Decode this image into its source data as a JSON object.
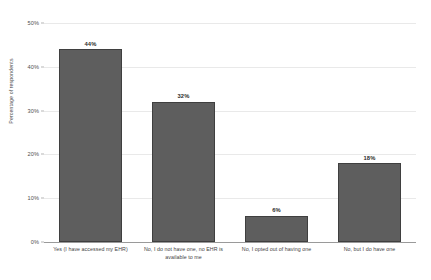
{
  "chart_data": {
    "type": "bar",
    "title": "",
    "xlabel": "",
    "ylabel": "Percentage of respondents",
    "categories": [
      "Yes (I have accessed my EHR)",
      "No, I do not have one, no EHR is available to me",
      "No, I opted out of having one",
      "No, but I do have one"
    ],
    "values": [
      44,
      32,
      6,
      18
    ],
    "value_labels": [
      "44%",
      "32%",
      "6%",
      "18%"
    ],
    "ylim": [
      0,
      50
    ],
    "yticks": [
      0,
      10,
      20,
      30,
      40,
      50
    ],
    "ytick_labels": [
      "0%",
      "10%",
      "20%",
      "30%",
      "40%",
      "50%"
    ],
    "grid": true,
    "legend": false,
    "bar_color": "#5e5e5e",
    "bar_edge_color": "#3f3f3f",
    "gridline_color": "#e9e9e9",
    "axis_color": "#9a9a9a",
    "background": "#ffffff"
  }
}
